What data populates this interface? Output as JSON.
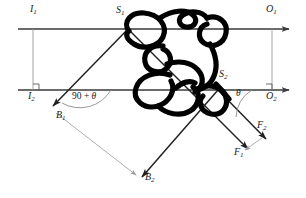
{
  "figure": {
    "type": "physics-force-diagram",
    "colors": {
      "line": "#3a3a3a",
      "knot": "#000000",
      "construction": "#9a9a9a",
      "text": "#1a1a1a",
      "background": "#ffffff"
    }
  },
  "labels": {
    "i1": {
      "text": "I",
      "sub": "1"
    },
    "i2": {
      "text": "I",
      "sub": "2"
    },
    "o1": {
      "text": "O",
      "sub": "1"
    },
    "o2": {
      "text": "O",
      "sub": "2"
    },
    "s1": {
      "text": "S",
      "sub": "1"
    },
    "s2": {
      "text": "S",
      "sub": "2"
    },
    "b1": {
      "text": "B",
      "sub": "1"
    },
    "b2": {
      "text": "B",
      "sub": "2"
    },
    "f1": {
      "text": "F",
      "sub": "1"
    },
    "f2": {
      "text": "F",
      "sub": "2"
    }
  },
  "angles": {
    "left": {
      "value": "90 + ",
      "symbol": "θ"
    },
    "right": {
      "symbol": "θ"
    }
  },
  "geometry": {
    "top_line_y": 29,
    "bottom_line_y": 90,
    "line_x_start": 18,
    "line_x_end": 296,
    "points": {
      "S1": [
        128,
        29
      ],
      "S2": [
        218,
        90
      ],
      "B1": [
        48,
        110
      ],
      "B2": [
        138,
        181
      ],
      "F1": [
        252,
        152
      ],
      "F2": [
        270,
        142
      ],
      "I_tick_x": 33,
      "O_tick_x": 272
    }
  }
}
